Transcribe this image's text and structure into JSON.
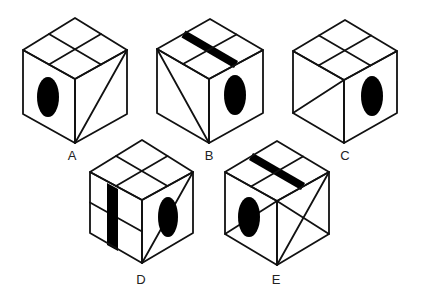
{
  "colors": {
    "line": "#111111",
    "fill": "#ffffff",
    "mark": "#000000"
  },
  "cubes": [
    {
      "label": "A",
      "label_pos": [
        72,
        149
      ],
      "geometry": {
        "top": [
          75,
          18
        ],
        "lt": [
          23,
          50
        ],
        "ft": [
          75,
          79
        ],
        "rt": [
          127,
          50
        ],
        "lb": [
          23,
          114
        ],
        "fb": [
          75,
          143
        ],
        "rb": [
          127,
          114
        ]
      },
      "top_face": {
        "type": "quarters",
        "bar": null
      },
      "left_face": {
        "lines": [],
        "oval": {
          "cx": 48,
          "cy": 97,
          "rx": 11,
          "ry": 20
        },
        "bar": null,
        "midline": false
      },
      "right_face": {
        "lines": [
          [
            "fb",
            "rt"
          ]
        ],
        "oval": null
      }
    },
    {
      "label": "B",
      "label_pos": [
        209,
        149
      ],
      "geometry": {
        "top": [
          210,
          19
        ],
        "lt": [
          157,
          49
        ],
        "ft": [
          209,
          79
        ],
        "rt": [
          263,
          50
        ],
        "lb": [
          157,
          113
        ],
        "fb": [
          209,
          143
        ],
        "rb": [
          263,
          113
        ]
      },
      "top_face": {
        "type": "quarters",
        "bar": "a"
      },
      "left_face": {
        "lines": [
          [
            "lt",
            "fb"
          ]
        ],
        "oval": null,
        "bar": null,
        "midline": false
      },
      "right_face": {
        "lines": [],
        "oval": {
          "cx": 235,
          "cy": 95,
          "rx": 11,
          "ry": 20
        }
      }
    },
    {
      "label": "C",
      "label_pos": [
        345,
        149
      ],
      "geometry": {
        "top": [
          345,
          20
        ],
        "lt": [
          293,
          51
        ],
        "ft": [
          344,
          80
        ],
        "rt": [
          397,
          51
        ],
        "lb": [
          293,
          113
        ],
        "fb": [
          344,
          143
        ],
        "rb": [
          397,
          113
        ]
      },
      "top_face": {
        "type": "quarters",
        "bar": null
      },
      "left_face": {
        "lines": [
          [
            "lb",
            "ft"
          ]
        ],
        "oval": null,
        "bar": null,
        "midline": false
      },
      "right_face": {
        "lines": [],
        "oval": {
          "cx": 372,
          "cy": 96,
          "rx": 11,
          "ry": 20
        }
      }
    },
    {
      "label": "D",
      "label_pos": [
        141,
        273
      ],
      "geometry": {
        "top": [
          142,
          140
        ],
        "lt": [
          90,
          172
        ],
        "ft": [
          142,
          200
        ],
        "rt": [
          193,
          172
        ],
        "lb": [
          90,
          233
        ],
        "fb": [
          142,
          263
        ],
        "rb": [
          193,
          233
        ]
      },
      "top_face": {
        "type": "quarters",
        "bar": null
      },
      "left_face": {
        "lines": [],
        "oval": null,
        "bar": "vertical",
        "midline": true
      },
      "right_face": {
        "lines": [
          [
            "fb",
            "rt"
          ]
        ],
        "oval": {
          "cx": 168,
          "cy": 217,
          "rx": 10,
          "ry": 20
        }
      }
    },
    {
      "label": "E",
      "label_pos": [
        276,
        273
      ],
      "geometry": {
        "top": [
          277,
          141
        ],
        "lt": [
          225,
          172
        ],
        "ft": [
          277,
          201
        ],
        "rt": [
          329,
          172
        ],
        "lb": [
          225,
          234
        ],
        "fb": [
          277,
          265
        ],
        "rb": [
          329,
          234
        ]
      },
      "top_face": {
        "type": "quarters",
        "bar": "a"
      },
      "left_face": {
        "lines": [
          [
            "lb",
            "ft"
          ]
        ],
        "oval": {
          "cx": 249,
          "cy": 217,
          "rx": 11,
          "ry": 20
        },
        "bar": null,
        "midline": false
      },
      "right_face": {
        "lines": [
          [
            "ft",
            "rb"
          ],
          [
            "fb",
            "rt"
          ]
        ],
        "oval": null
      }
    }
  ]
}
